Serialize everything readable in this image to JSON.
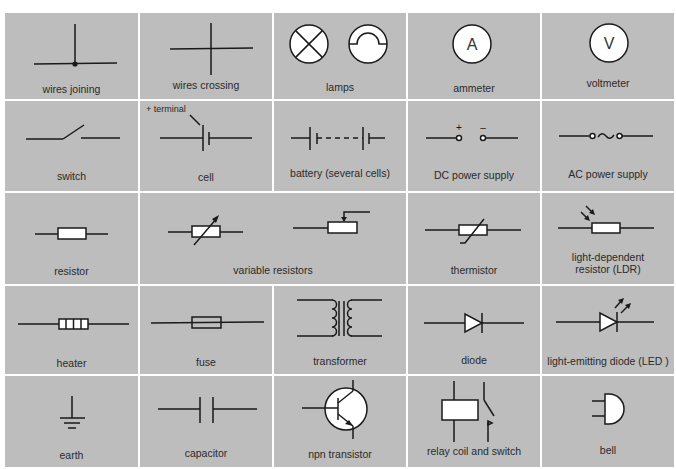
{
  "colors": {
    "cell_background": "#bdbdbd",
    "grid_lines": "#ffffff",
    "symbol_stroke": "#1a1a1a",
    "symbol_fill": "#ffffff"
  },
  "symbols": [
    {
      "id": "wires-joining",
      "label": "wires joining"
    },
    {
      "id": "wires-crossing",
      "label": "wires crossing"
    },
    {
      "id": "lamps",
      "label": "lamps"
    },
    {
      "id": "ammeter",
      "label": "ammeter",
      "glyph": "A"
    },
    {
      "id": "voltmeter",
      "label": "voltmeter",
      "glyph": "V"
    },
    {
      "id": "switch",
      "label": "switch"
    },
    {
      "id": "cell",
      "label": "cell",
      "annotation": "+ terminal"
    },
    {
      "id": "battery",
      "label": "battery (several cells)"
    },
    {
      "id": "dc-power-supply",
      "label": "DC power supply",
      "plus": "+",
      "minus": "–"
    },
    {
      "id": "ac-power-supply",
      "label": "AC power supply"
    },
    {
      "id": "resistor",
      "label": "resistor"
    },
    {
      "id": "variable-resistors",
      "label": "variable resistors"
    },
    {
      "id": "thermistor",
      "label": "thermistor"
    },
    {
      "id": "ldr",
      "label_line1": "light-dependent",
      "label_line2": "resistor (LDR)"
    },
    {
      "id": "heater",
      "label": "heater"
    },
    {
      "id": "fuse",
      "label": "fuse"
    },
    {
      "id": "transformer",
      "label": "transformer"
    },
    {
      "id": "diode",
      "label": "diode"
    },
    {
      "id": "led",
      "label": "light-emitting diode (LED )"
    },
    {
      "id": "earth",
      "label": "earth"
    },
    {
      "id": "capacitor",
      "label": "capacitor"
    },
    {
      "id": "npn-transistor",
      "label": "npn transistor"
    },
    {
      "id": "relay",
      "label": "relay coil and switch"
    },
    {
      "id": "bell",
      "label": "bell"
    }
  ]
}
